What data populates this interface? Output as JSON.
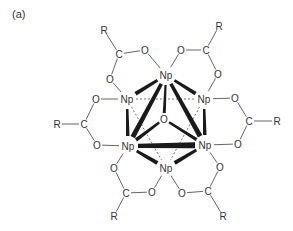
{
  "panel_label": "(a)",
  "diagram": {
    "atoms": {
      "np_top": {
        "label": "Np",
        "x": 166,
        "y": 75
      },
      "np_ul": {
        "label": "Np",
        "x": 127,
        "y": 99
      },
      "np_ur": {
        "label": "Np",
        "x": 204,
        "y": 99
      },
      "np_ll": {
        "label": "Np",
        "x": 128,
        "y": 146
      },
      "np_lr": {
        "label": "Np",
        "x": 205,
        "y": 145
      },
      "np_bot": {
        "label": "Np",
        "x": 166,
        "y": 168
      },
      "o_center": {
        "label": "O",
        "x": 164,
        "y": 119
      },
      "tl_r": {
        "label": "R",
        "x": 104,
        "y": 30
      },
      "tl_c": {
        "label": "C",
        "x": 119,
        "y": 54
      },
      "tl_o1": {
        "label": "O",
        "x": 145,
        "y": 50
      },
      "tl_o2": {
        "label": "O",
        "x": 110,
        "y": 79
      },
      "tr_r": {
        "label": "R",
        "x": 219,
        "y": 26
      },
      "tr_c": {
        "label": "C",
        "x": 206,
        "y": 50
      },
      "tr_o1": {
        "label": "O",
        "x": 181,
        "y": 50
      },
      "tr_o2": {
        "label": "O",
        "x": 218,
        "y": 74
      },
      "l_r": {
        "label": "R",
        "x": 57,
        "y": 124
      },
      "l_c": {
        "label": "C",
        "x": 84,
        "y": 124
      },
      "l_o1": {
        "label": "O",
        "x": 96,
        "y": 99
      },
      "l_o2": {
        "label": "O",
        "x": 97,
        "y": 145
      },
      "r_r": {
        "label": "R",
        "x": 277,
        "y": 121
      },
      "r_c": {
        "label": "C",
        "x": 249,
        "y": 121
      },
      "r_o1": {
        "label": "O",
        "x": 235,
        "y": 98
      },
      "r_o2": {
        "label": "O",
        "x": 238,
        "y": 144
      },
      "bl_r": {
        "label": "R",
        "x": 114,
        "y": 216
      },
      "bl_c": {
        "label": "C",
        "x": 126,
        "y": 193
      },
      "bl_o1": {
        "label": "O",
        "x": 114,
        "y": 168
      },
      "bl_o2": {
        "label": "O",
        "x": 152,
        "y": 192
      },
      "br_r": {
        "label": "R",
        "x": 223,
        "y": 216
      },
      "br_c": {
        "label": "C",
        "x": 208,
        "y": 191
      },
      "br_o1": {
        "label": "O",
        "x": 220,
        "y": 167
      },
      "br_o2": {
        "label": "O",
        "x": 182,
        "y": 193
      }
    },
    "thin_bonds": [
      [
        "tl_r",
        "tl_c"
      ],
      [
        "tl_c",
        "tl_o1"
      ],
      [
        "tl_c",
        "tl_o2"
      ],
      [
        "tl_o1",
        "np_top"
      ],
      [
        "tl_o2",
        "np_ul"
      ],
      [
        "tr_r",
        "tr_c"
      ],
      [
        "tr_c",
        "tr_o1"
      ],
      [
        "tr_c",
        "tr_o2"
      ],
      [
        "tr_o1",
        "np_top"
      ],
      [
        "tr_o2",
        "np_ur"
      ],
      [
        "l_r",
        "l_c"
      ],
      [
        "l_c",
        "l_o1"
      ],
      [
        "l_c",
        "l_o2"
      ],
      [
        "l_o1",
        "np_ul"
      ],
      [
        "l_o2",
        "np_ll"
      ],
      [
        "r_r",
        "r_c"
      ],
      [
        "r_c",
        "r_o1"
      ],
      [
        "r_c",
        "r_o2"
      ],
      [
        "r_o1",
        "np_ur"
      ],
      [
        "r_o2",
        "np_lr"
      ],
      [
        "bl_r",
        "bl_c"
      ],
      [
        "bl_c",
        "bl_o1"
      ],
      [
        "bl_c",
        "bl_o2"
      ],
      [
        "bl_o1",
        "np_ll"
      ],
      [
        "bl_o2",
        "np_bot"
      ],
      [
        "br_r",
        "br_c"
      ],
      [
        "br_c",
        "br_o1"
      ],
      [
        "br_c",
        "br_o2"
      ],
      [
        "br_o1",
        "np_lr"
      ],
      [
        "br_o2",
        "np_bot"
      ]
    ],
    "thick_bonds": [
      [
        "np_top",
        "np_ul",
        4
      ],
      [
        "np_top",
        "np_ur",
        4
      ],
      [
        "np_top",
        "np_ll",
        5
      ],
      [
        "np_top",
        "np_lr",
        5
      ],
      [
        "np_top",
        "o_center",
        3
      ],
      [
        "np_ul",
        "np_ll",
        3.5
      ],
      [
        "np_ur",
        "np_lr",
        3.5
      ],
      [
        "np_ll",
        "np_lr",
        6
      ],
      [
        "np_ll",
        "np_bot",
        4
      ],
      [
        "np_lr",
        "np_bot",
        4
      ],
      [
        "o_center",
        "np_ll",
        3.5
      ],
      [
        "o_center",
        "np_lr",
        3.5
      ]
    ],
    "dashed_bonds": [
      [
        "np_ul",
        "np_ur"
      ],
      [
        "np_ul",
        "np_bot"
      ],
      [
        "np_ur",
        "np_bot"
      ]
    ]
  }
}
